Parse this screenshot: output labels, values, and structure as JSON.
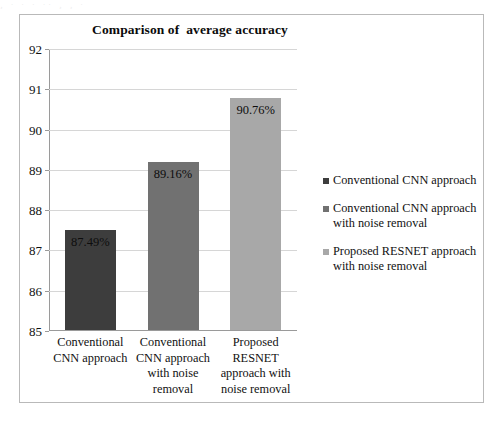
{
  "artifact": {
    "clipped_text": "¸  ·   ·  ·   ·· ¸ ¸  ·"
  },
  "chart_data": {
    "type": "bar",
    "title": "Comparison of  average accuracy",
    "xlabel": "",
    "ylabel": "",
    "ylim": [
      85,
      92
    ],
    "yticks": [
      "85",
      "86",
      "87",
      "88",
      "89",
      "90",
      "91",
      "92"
    ],
    "grid": true,
    "legend_position": "right",
    "categories": [
      "Conventional CNN approach",
      "Conventional CNN approach with noise removal",
      "Proposed RESNET approach with noise removal"
    ],
    "category_label_lines": [
      [
        "Conventional",
        "CNN approach"
      ],
      [
        "Conventional",
        "CNN approach",
        "with noise",
        "removal"
      ],
      [
        "Proposed",
        "RESNET",
        "approach with",
        "noise removal"
      ]
    ],
    "values": [
      87.49,
      89.16,
      90.76
    ],
    "value_labels": [
      "87.49%",
      "89.16%",
      "90.76%"
    ],
    "colors": [
      "#3d3d3d",
      "#717171",
      "#a8a8a8"
    ],
    "legend_entries": [
      {
        "label": "Conventional CNN approach",
        "lines": [
          "Conventional CNN approach"
        ],
        "color": "#3d3d3d"
      },
      {
        "label": "Conventional CNN approach with noise removal",
        "lines": [
          "Conventional CNN approach",
          "with noise removal"
        ],
        "color": "#717171"
      },
      {
        "label": "Proposed RESNET approach with noise removal",
        "lines": [
          "Proposed RESNET approach",
          "with noise removal"
        ],
        "color": "#a8a8a8"
      }
    ]
  },
  "style": {
    "frame_border": "#b9b9b9",
    "gridline_color": "#d6d6d6",
    "axis_color": "#9a9a9a",
    "text_color": "#111111"
  }
}
